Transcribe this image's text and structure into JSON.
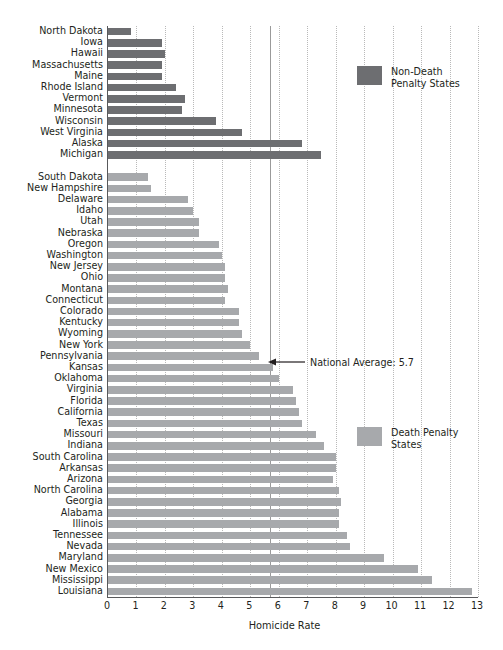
{
  "chart_data": {
    "type": "bar",
    "orientation": "horizontal",
    "title": "",
    "xlabel": "Homicide Rate",
    "ylabel": "",
    "xlim": [
      0,
      13
    ],
    "xticks": [
      0,
      1,
      2,
      3,
      4,
      5,
      6,
      7,
      8,
      9,
      10,
      11,
      12,
      13
    ],
    "grid": "vertical dotted gridlines at each integer tick",
    "legend_position": "inside plot, right side (two blocks)",
    "series": [
      {
        "name": "Non-Death Penalty States",
        "color": "#6d6e71",
        "categories": [
          "North Dakota",
          "Iowa",
          "Hawaii",
          "Massachusetts",
          "Maine",
          "Rhode Island",
          "Vermont",
          "Minnesota",
          "Wisconsin",
          "West Virginia",
          "Alaska",
          "Michigan"
        ],
        "values": [
          0.8,
          1.9,
          2.0,
          1.9,
          1.9,
          2.4,
          2.7,
          2.6,
          3.8,
          4.7,
          6.8,
          7.5
        ]
      },
      {
        "name": "Death Penalty States",
        "color": "#a7a9ac",
        "categories": [
          "South Dakota",
          "New Hampshire",
          "Delaware",
          "Idaho",
          "Utah",
          "Nebraska",
          "Oregon",
          "Washington",
          "New Jersey",
          "Ohio",
          "Montana",
          "Connecticut",
          "Colorado",
          "Kentucky",
          "Wyoming",
          "New York",
          "Pennsylvania",
          "Kansas",
          "Oklahoma",
          "Virginia",
          "Florida",
          "California",
          "Texas",
          "Missouri",
          "Indiana",
          "South Carolina",
          "Arkansas",
          "Arizona",
          "North Carolina",
          "Georgia",
          "Alabama",
          "Illinois",
          "Tennessee",
          "Nevada",
          "Maryland",
          "New Mexico",
          "Mississippi",
          "Louisiana"
        ],
        "values": [
          1.4,
          1.5,
          2.8,
          3.0,
          3.2,
          3.2,
          3.9,
          4.0,
          4.1,
          4.1,
          4.2,
          4.1,
          4.6,
          4.6,
          4.7,
          5.0,
          5.3,
          5.8,
          6.0,
          6.5,
          6.6,
          6.7,
          6.8,
          7.3,
          7.6,
          8.0,
          8.0,
          7.9,
          8.1,
          8.2,
          8.1,
          8.1,
          8.4,
          8.5,
          9.7,
          10.9,
          11.4,
          12.8
        ]
      }
    ],
    "annotations": [
      {
        "label": "National Average: 5.7",
        "value": 5.7,
        "style": "left-pointing arrow to vertical reference line"
      }
    ]
  },
  "axis": {
    "x_title": "Homicide Rate",
    "tick_labels": [
      "0",
      "1",
      "2",
      "3",
      "4",
      "5",
      "6",
      "7",
      "8",
      "9",
      "10",
      "11",
      "12",
      "13"
    ]
  },
  "legend": {
    "non_death": "Non-Death\nPenalty States",
    "death": "Death Penalty\nStates"
  },
  "annotation": {
    "national_average": "National Average: 5.7"
  },
  "colors": {
    "dark_bar": "#6d6e71",
    "light_bar": "#a7a9ac",
    "axis": "#58595b",
    "grid": "#b9b9b9",
    "text": "#231f20"
  }
}
